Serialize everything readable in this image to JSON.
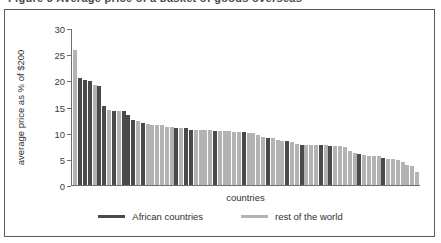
{
  "figure": {
    "title_partial": "Figure 3  Average price of a basket of goods  overseas",
    "frame_color": "#5a5a5a"
  },
  "legend": {
    "position": "bottom-center",
    "items": [
      {
        "label": "African countries",
        "color": "#4a4a4a",
        "swatch": "line-swatch"
      },
      {
        "label": "rest of the world",
        "color": "#b3b3b3",
        "swatch": "line-swatch"
      }
    ]
  },
  "chart_data": {
    "type": "bar",
    "title": "",
    "subtitle": "",
    "xlabel": "countries",
    "ylabel": "average price as % of $200",
    "ylim": [
      0,
      30
    ],
    "yticks": [
      0,
      5,
      10,
      15,
      20,
      25,
      30
    ],
    "ytick_labels": [
      "0",
      "5",
      "10",
      "15",
      "20",
      "25",
      "30"
    ],
    "grid": false,
    "legend_position": "bottom",
    "categories": [
      "c1",
      "c2",
      "c3",
      "c4",
      "c5",
      "c6",
      "c7",
      "c8",
      "c9",
      "c10",
      "c11",
      "c12",
      "c13",
      "c14",
      "c15",
      "c16",
      "c17",
      "c18",
      "c19",
      "c20",
      "c21",
      "c22",
      "c23",
      "c24",
      "c25",
      "c26",
      "c27",
      "c28",
      "c29",
      "c30",
      "c31",
      "c32",
      "c33",
      "c34",
      "c35",
      "c36",
      "c37",
      "c38",
      "c39",
      "c40",
      "c41",
      "c42",
      "c43",
      "c44",
      "c45",
      "c46",
      "c47",
      "c48",
      "c49",
      "c50",
      "c51",
      "c52",
      "c53",
      "c54",
      "c55",
      "c56",
      "c57",
      "c58",
      "c59",
      "c60",
      "c61",
      "c62",
      "c63",
      "c64",
      "c65",
      "c66",
      "c67",
      "c68",
      "c69",
      "c70",
      "c71",
      "c72"
    ],
    "values": [
      25.8,
      20.5,
      20.0,
      19.9,
      19.2,
      19.0,
      15.1,
      14.4,
      14.2,
      14.2,
      14.1,
      13.3,
      12.4,
      12.2,
      11.8,
      11.7,
      11.5,
      11.5,
      11.4,
      11.0,
      11.0,
      10.9,
      10.9,
      10.8,
      10.5,
      10.5,
      10.5,
      10.5,
      10.4,
      10.4,
      10.4,
      10.3,
      10.2,
      10.1,
      10.0,
      9.9,
      9.5,
      9.2,
      9.0,
      8.9,
      8.5,
      8.4,
      8.3,
      7.7,
      7.7,
      7.6,
      7.6,
      7.6,
      7.6,
      7.5,
      7.5,
      7.4,
      7.2,
      6.5,
      6.2,
      5.7,
      5.6,
      5.6,
      5.5,
      5.2,
      5.0,
      4.9,
      4.8,
      3.9,
      3.7,
      2.5,
      10.5,
      10.1,
      8.6,
      7.8,
      6.0,
      4.4
    ],
    "series_of_point": [
      "rest",
      "african",
      "african",
      "african",
      "rest",
      "african",
      "african",
      "rest",
      "african",
      "rest",
      "african",
      "african",
      "african",
      "rest",
      "african",
      "rest",
      "rest",
      "rest",
      "rest",
      "rest",
      "rest",
      "african",
      "rest",
      "african",
      "african",
      "rest",
      "rest",
      "rest",
      "african",
      "rest",
      "rest",
      "rest",
      "rest",
      "rest",
      "rest",
      "rest",
      "rest",
      "rest",
      "african",
      "rest",
      "rest",
      "african",
      "rest",
      "african",
      "rest",
      "rest",
      "rest",
      "african",
      "rest",
      "african",
      "rest",
      "rest",
      "rest",
      "rest",
      "rest",
      "rest",
      "rest",
      "rest",
      "rest",
      "african",
      "rest",
      "rest",
      "rest",
      "rest",
      "rest",
      "rest",
      "rest",
      "african",
      "rest",
      "rest",
      "african",
      "rest"
    ],
    "series": [
      {
        "name": "African countries",
        "color": "#4a4a4a"
      },
      {
        "name": "rest of the world",
        "color": "#b3b3b3"
      }
    ]
  }
}
